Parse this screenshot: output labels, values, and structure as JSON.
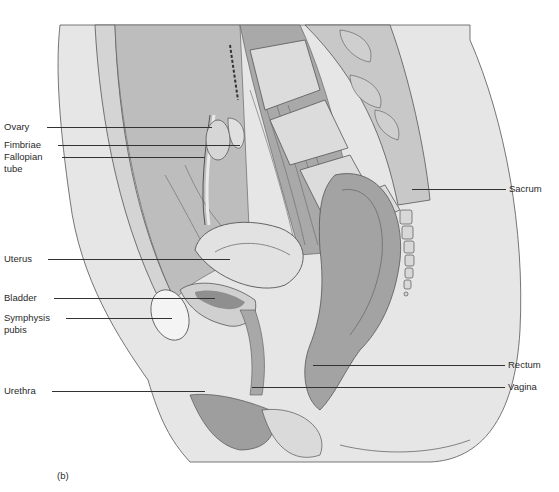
{
  "figure": {
    "panel_label": "(b)"
  },
  "labels_left": [
    {
      "id": "ovary",
      "text": "Ovary",
      "x": 4,
      "y": 121,
      "line_x1": 47,
      "line_x2": 212,
      "line_y": 127
    },
    {
      "id": "fimbriae",
      "text": "Fimbriae",
      "x": 4,
      "y": 140,
      "line_x1": 58,
      "line_x2": 240,
      "line_y": 145
    },
    {
      "id": "fallopian-tube",
      "text": "Fallopian",
      "text2": "tube",
      "x": 4,
      "y": 152,
      "line_x1": 62,
      "line_x2": 205,
      "line_y": 157
    },
    {
      "id": "uterus",
      "text": "Uterus",
      "x": 4,
      "y": 253,
      "line_x1": 48,
      "line_x2": 230,
      "line_y": 259
    },
    {
      "id": "bladder",
      "text": "Bladder",
      "x": 4,
      "y": 292,
      "line_x1": 54,
      "line_x2": 215,
      "line_y": 298
    },
    {
      "id": "symphysis-pubis",
      "text": "Symphysis",
      "text2": "pubis",
      "x": 4,
      "y": 313,
      "line_x1": 66,
      "line_x2": 172,
      "line_y": 318
    },
    {
      "id": "urethra",
      "text": "Urethra",
      "x": 4,
      "y": 385,
      "line_x1": 52,
      "line_x2": 205,
      "line_y": 391
    }
  ],
  "labels_right": [
    {
      "id": "sacrum",
      "text": "Sacrum",
      "x": 509,
      "y": 184,
      "line_x1": 412,
      "line_x2": 506,
      "line_y": 189
    },
    {
      "id": "rectum",
      "text": "Rectum",
      "x": 508,
      "y": 359,
      "line_x1": 313,
      "line_x2": 505,
      "line_y": 365
    },
    {
      "id": "vagina",
      "text": "Vagina",
      "x": 508,
      "y": 381,
      "line_x1": 252,
      "line_x2": 505,
      "line_y": 387
    }
  ]
}
